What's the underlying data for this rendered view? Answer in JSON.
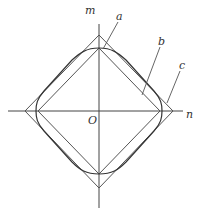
{
  "diagram": {
    "axes": {
      "vertical_label": "m",
      "horizontal_label": "n",
      "origin_label": "O"
    },
    "curves": [
      {
        "id": "a",
        "label": "a",
        "shape": "inner diamond"
      },
      {
        "id": "b",
        "label": "b",
        "shape": "rounded square (superellipse)"
      },
      {
        "id": "c",
        "label": "c",
        "shape": "outer diamond"
      }
    ],
    "colors": {
      "line": "#555555",
      "text": "#333333",
      "background": "#ffffff"
    }
  }
}
